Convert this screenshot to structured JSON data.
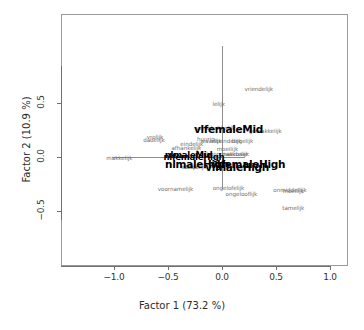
{
  "chart_data": {
    "type": "scatter",
    "title": "",
    "xlabel": "Factor 1  (73.2 %)",
    "ylabel": "Factor 2  (10.9 %)",
    "xlim": [
      -1.25,
      1.18
    ],
    "ylim": [
      -0.93,
      0.78
    ],
    "xticks": [
      "-1.0",
      "-0.5",
      "0.0",
      "0.5",
      "1.0"
    ],
    "xtick_values": [
      -1.0,
      -0.5,
      0.0,
      0.5,
      1.0
    ],
    "yticks": [
      "0.5",
      "0.0",
      "-0.5"
    ],
    "ytick_values": [
      0.5,
      0.0,
      -0.5
    ],
    "grid": false,
    "legend": "none",
    "reference_lines": {
      "h": 0.0,
      "v": 0.0
    },
    "variance_explained": {
      "factor1_pct": 73.2,
      "factor2_pct": 10.9
    },
    "series": [
      {
        "name": "words",
        "style": "grey-small-text",
        "points": [
          {
            "label": "vriendelijk",
            "x": 0.34,
            "y": 0.62
          },
          {
            "label": "lelijk",
            "x": -0.03,
            "y": 0.48
          },
          {
            "label": "verschrikkelijk",
            "x": -0.06,
            "y": 0.255
          },
          {
            "label": "gemakkelijk",
            "x": 0.4,
            "y": 0.235
          },
          {
            "label": "vrolijk",
            "x": -0.62,
            "y": 0.175
          },
          {
            "label": "dadelijk",
            "x": -0.63,
            "y": 0.145
          },
          {
            "label": "huurig",
            "x": -0.15,
            "y": 0.155
          },
          {
            "label": "waarlijk",
            "x": -0.1,
            "y": 0.135
          },
          {
            "label": "uiteindelijk",
            "x": 0.04,
            "y": 0.135
          },
          {
            "label": "begelijk",
            "x": 0.19,
            "y": 0.135
          },
          {
            "label": "eindelijk",
            "x": -0.28,
            "y": 0.115
          },
          {
            "label": "afhankelijk",
            "x": -0.33,
            "y": 0.075
          },
          {
            "label": "moeilijk",
            "x": 0.05,
            "y": 0.065
          },
          {
            "label": "makkelijk",
            "x": -0.95,
            "y": -0.015
          },
          {
            "label": "schoonmaakbaar",
            "x": 0.02,
            "y": 0.015
          },
          {
            "label": "natuurlijk",
            "x": 0.13,
            "y": 0.015
          },
          {
            "label": "eerlijk",
            "x": -0.3,
            "y": -0.105
          },
          {
            "label": "duidelijk",
            "x": -0.25,
            "y": -0.105
          },
          {
            "label": "voornamelijk",
            "x": -0.43,
            "y": -0.305
          },
          {
            "label": "ongelofelijk",
            "x": 0.06,
            "y": -0.295
          },
          {
            "label": "ongelooflijk",
            "x": 0.18,
            "y": -0.355
          },
          {
            "label": "onmiddellijk",
            "x": 0.63,
            "y": -0.315
          },
          {
            "label": "moeilijk",
            "x": 0.66,
            "y": -0.325
          },
          {
            "label": "tamelijk",
            "x": 0.66,
            "y": -0.485
          }
        ]
      },
      {
        "name": "groups",
        "style": "black-bold-text",
        "points": [
          {
            "label": "vlfemaleMid",
            "x": 0.06,
            "y": 0.26
          },
          {
            "label": "nlmaleMid",
            "x": -0.31,
            "y": 0.02
          },
          {
            "label": "nlfemaleHigh",
            "x": -0.26,
            "y": 0.0
          },
          {
            "label": "nlmaleHigh",
            "x": -0.23,
            "y": -0.065
          },
          {
            "label": "vlfemaleHigh",
            "x": 0.24,
            "y": -0.065
          },
          {
            "label": "vlmaleHigh",
            "x": 0.14,
            "y": -0.09
          }
        ]
      }
    ]
  }
}
